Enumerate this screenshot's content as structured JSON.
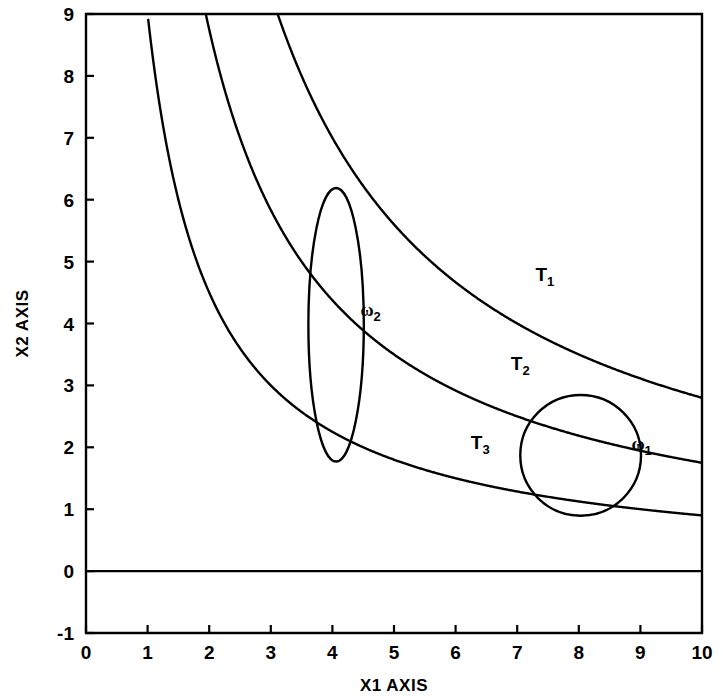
{
  "chart_data": {
    "type": "line",
    "title": "",
    "xlabel": "X1 AXIS",
    "ylabel": "X2 AXIS",
    "xlim": [
      0,
      10
    ],
    "ylim": [
      -1,
      9
    ],
    "xticks": [
      0,
      1,
      2,
      3,
      4,
      5,
      6,
      7,
      8,
      9,
      10
    ],
    "yticks": [
      -1,
      0,
      1,
      2,
      3,
      4,
      5,
      6,
      7,
      8,
      9
    ],
    "xtick_labels": [
      "0",
      "1",
      "2",
      "3",
      "4",
      "5",
      "6",
      "7",
      "8",
      "9",
      "10"
    ],
    "ytick_labels": [
      "-1",
      "0",
      "1",
      "2",
      "3",
      "4",
      "5",
      "6",
      "7",
      "8",
      "9"
    ],
    "grid": false,
    "legend": "none",
    "line_color": "#000000",
    "series": [
      {
        "name": "T1",
        "label": "T<sub>1</sub>",
        "kind": "hyperbola",
        "equation": "x2 = 28 / x1",
        "constant": 28,
        "label_x": 7.45,
        "label_y": 4.68,
        "points": [
          {
            "x": 3.11,
            "y": 9.0
          },
          {
            "x": 3.5,
            "y": 8.0
          },
          {
            "x": 4.0,
            "y": 7.0
          },
          {
            "x": 4.67,
            "y": 6.0
          },
          {
            "x": 5.6,
            "y": 5.0
          },
          {
            "x": 7.0,
            "y": 4.0
          },
          {
            "x": 8.0,
            "y": 3.5
          },
          {
            "x": 9.33,
            "y": 3.0
          },
          {
            "x": 10.0,
            "y": 2.8
          }
        ]
      },
      {
        "name": "T2",
        "label": "T<sub>2</sub>",
        "kind": "hyperbola",
        "equation": "x2 = 17.5 / x1",
        "constant": 17.5,
        "label_x": 7.05,
        "label_y": 3.25,
        "points": [
          {
            "x": 1.94,
            "y": 9.0
          },
          {
            "x": 2.19,
            "y": 8.0
          },
          {
            "x": 2.5,
            "y": 7.0
          },
          {
            "x": 2.92,
            "y": 6.0
          },
          {
            "x": 3.5,
            "y": 5.0
          },
          {
            "x": 4.38,
            "y": 4.0
          },
          {
            "x": 5.83,
            "y": 3.0
          },
          {
            "x": 7.0,
            "y": 2.5
          },
          {
            "x": 8.75,
            "y": 2.0
          },
          {
            "x": 10.0,
            "y": 1.75
          }
        ]
      },
      {
        "name": "T3",
        "label": "T<sub>3</sub>",
        "kind": "hyperbola",
        "equation": "x2 = 9 / x1",
        "constant": 9,
        "label_x": 6.4,
        "label_y": 1.98,
        "points": [
          {
            "x": 1.0,
            "y": 9.0
          },
          {
            "x": 1.13,
            "y": 8.0
          },
          {
            "x": 1.29,
            "y": 7.0
          },
          {
            "x": 1.5,
            "y": 6.0
          },
          {
            "x": 1.8,
            "y": 5.0
          },
          {
            "x": 2.25,
            "y": 4.0
          },
          {
            "x": 3.0,
            "y": 3.0
          },
          {
            "x": 4.5,
            "y": 2.0
          },
          {
            "x": 6.0,
            "y": 1.5
          },
          {
            "x": 9.0,
            "y": 1.0
          },
          {
            "x": 10.0,
            "y": 0.9
          }
        ]
      }
    ],
    "shapes": [
      {
        "name": "omega1",
        "label": "ω",
        "sublabel": "1",
        "type": "circle",
        "cx": 8.03,
        "cy": 1.87,
        "r": 0.98,
        "label_x": 9.02,
        "label_y": 1.95
      },
      {
        "name": "omega2",
        "label": "ω",
        "sublabel": "2",
        "type": "ellipse",
        "cx": 4.06,
        "cy": 3.98,
        "rx": 0.45,
        "ry": 2.21,
        "label_x": 4.62,
        "label_y": 4.12
      }
    ],
    "reference_lines": [
      {
        "name": "zero-line",
        "orientation": "horizontal",
        "y": 0
      }
    ],
    "annotations": []
  }
}
